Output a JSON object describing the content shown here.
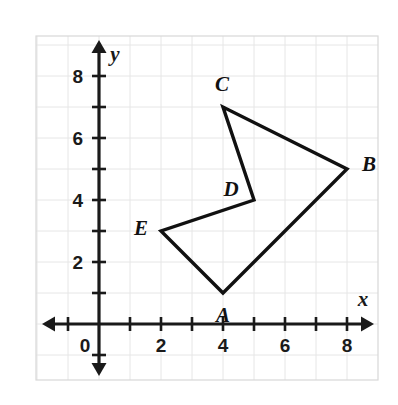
{
  "chart_data": {
    "type": "scatter",
    "title": "",
    "xlabel": "x",
    "ylabel": "y",
    "xlim": [
      -1.8,
      9.4
    ],
    "ylim": [
      -1.5,
      9.1
    ],
    "grid": true,
    "grid_spacing": 1,
    "legend": "none",
    "origin_label": "0",
    "x_ticks": [
      2,
      4,
      6,
      8
    ],
    "x_tick_labels": [
      "2",
      "4",
      "6",
      "8"
    ],
    "y_ticks": [
      2,
      4,
      6,
      8
    ],
    "y_tick_labels": [
      "2",
      "4",
      "6",
      "8"
    ],
    "shape_name": "ABCDE",
    "shape_closed": true,
    "points": [
      {
        "label": "A",
        "x": 4,
        "y": 1,
        "label_dx": 0,
        "label_dy": -22
      },
      {
        "label": "B",
        "x": 8,
        "y": 5,
        "label_dx": 22,
        "label_dy": 5
      },
      {
        "label": "C",
        "x": 4,
        "y": 7,
        "label_dx": -1,
        "label_dy": 23
      },
      {
        "label": "D",
        "x": 5,
        "y": 4,
        "label_dx": -23,
        "label_dy": 11
      },
      {
        "label": "E",
        "x": 2,
        "y": 3,
        "label_dx": -20,
        "label_dy": 3
      }
    ],
    "edges": [
      [
        "A",
        "B"
      ],
      [
        "B",
        "C"
      ],
      [
        "C",
        "D"
      ],
      [
        "D",
        "E"
      ],
      [
        "E",
        "A"
      ]
    ]
  },
  "geometry": {
    "origin_px": {
      "x": 99,
      "y": 324
    },
    "unit_px": 31,
    "frame": {
      "left": 36,
      "top": 36,
      "right": 378,
      "bottom": 380
    }
  },
  "colors": {
    "axis": "#1a1a1a",
    "grid": "#e6e6e6",
    "shape_stroke": "#111111",
    "frame": "#d8d8d8",
    "background": "#ffffff"
  }
}
